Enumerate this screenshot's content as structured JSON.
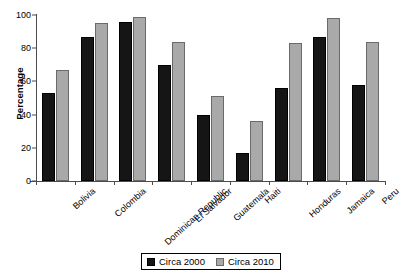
{
  "chart_data": {
    "type": "bar",
    "title": "",
    "xlabel": "",
    "ylabel": "Percentage",
    "ylim": [
      0,
      100
    ],
    "yticks": [
      0,
      20,
      40,
      60,
      80,
      100
    ],
    "grid": false,
    "legend_position": "bottom-center",
    "categories": [
      "Bolivia",
      "Colombia",
      "Dominican Republic",
      "El Salvador",
      "Guatemala",
      "Haiti",
      "Honduras",
      "Jamaica",
      "Peru"
    ],
    "series": [
      {
        "name": "Circa 2000",
        "color": "#151515",
        "values": [
          53,
          87,
          96,
          70,
          40,
          17,
          56,
          87,
          58
        ]
      },
      {
        "name": "Circa 2010",
        "color": "#a9a9a9",
        "values": [
          67,
          95,
          99,
          84,
          51,
          36,
          83,
          98,
          84
        ]
      }
    ]
  },
  "legend": {
    "items": [
      {
        "label": "Circa 2000"
      },
      {
        "label": "Circa 2010"
      }
    ]
  },
  "colors": {
    "series_2000": "#151515",
    "series_2010": "#a9a9a9",
    "axis": "#4c4c4c",
    "background": "#ffffff"
  }
}
